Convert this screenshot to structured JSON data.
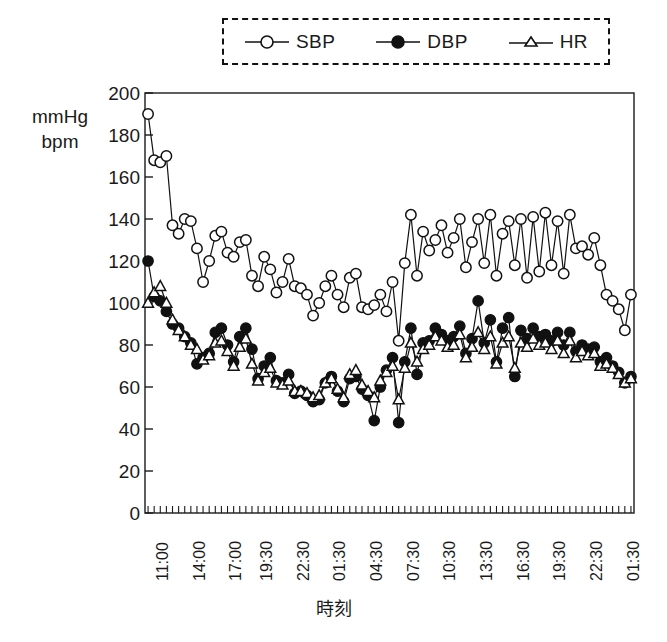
{
  "legend": {
    "position": "top-center",
    "border_style": "dashed",
    "entries": [
      {
        "label": "SBP",
        "marker": "open-circle-icon"
      },
      {
        "label": "DBP",
        "marker": "filled-circle-icon"
      },
      {
        "label": "HR",
        "marker": "open-triangle-icon"
      }
    ]
  },
  "axes": {
    "ylabel_line1": "mmHg",
    "ylabel_line2": "bpm",
    "xlabel": "時刻"
  },
  "chart_data": {
    "type": "line",
    "title": "",
    "subtitle": "",
    "xlabel": "時刻",
    "ylabel": "mmHg bpm",
    "ylim": [
      0,
      200
    ],
    "yticks": [
      0,
      20,
      40,
      60,
      80,
      100,
      120,
      140,
      160,
      180,
      200
    ],
    "grid": false,
    "legend_position": "top-center",
    "x_tick_labels": [
      "11:00",
      "14:00",
      "17:00",
      "19:30",
      "22:30",
      "01:30",
      "04:30",
      "07:30",
      "10:30",
      "13:30",
      "16:30",
      "19:30",
      "22:30",
      "01:30"
    ],
    "x_tick_indices": [
      0,
      6,
      12,
      17,
      23,
      29,
      35,
      41,
      47,
      53,
      59,
      65,
      71,
      77
    ],
    "n_points": 80,
    "series": [
      {
        "name": "SBP",
        "marker": "open-circle",
        "values": [
          190,
          168,
          167,
          170,
          137,
          133,
          140,
          139,
          126,
          110,
          120,
          132,
          134,
          124,
          122,
          129,
          130,
          113,
          108,
          122,
          116,
          105,
          110,
          121,
          108,
          107,
          104,
          94,
          100,
          108,
          113,
          104,
          98,
          112,
          114,
          98,
          97,
          99,
          104,
          96,
          110,
          82,
          119,
          142,
          113,
          134,
          125,
          130,
          137,
          124,
          131,
          140,
          117,
          129,
          140,
          119,
          142,
          113,
          133,
          139,
          118,
          140,
          112,
          141,
          115,
          143,
          118,
          139,
          114,
          142,
          126,
          127,
          123,
          131,
          118,
          104,
          101,
          97,
          87,
          104
        ]
      },
      {
        "name": "DBP",
        "marker": "filled-circle",
        "values": [
          120,
          103,
          101,
          96,
          90,
          88,
          84,
          81,
          71,
          74,
          76,
          86,
          88,
          80,
          72,
          84,
          88,
          78,
          64,
          70,
          74,
          63,
          62,
          66,
          57,
          58,
          56,
          53,
          54,
          62,
          65,
          58,
          53,
          64,
          65,
          59,
          56,
          44,
          60,
          68,
          74,
          43,
          72,
          88,
          66,
          81,
          82,
          88,
          85,
          82,
          84,
          89,
          76,
          83,
          101,
          81,
          92,
          72,
          88,
          93,
          65,
          87,
          83,
          88,
          84,
          85,
          82,
          86,
          80,
          86,
          77,
          80,
          78,
          79,
          72,
          74,
          70,
          67,
          62,
          65
        ]
      },
      {
        "name": "HR",
        "marker": "open-triangle",
        "values": [
          100,
          105,
          108,
          100,
          92,
          87,
          84,
          80,
          78,
          73,
          75,
          81,
          82,
          77,
          70,
          79,
          83,
          71,
          63,
          67,
          69,
          62,
          61,
          63,
          58,
          58,
          57,
          55,
          56,
          62,
          64,
          59,
          55,
          66,
          68,
          61,
          58,
          55,
          63,
          67,
          70,
          54,
          69,
          81,
          72,
          78,
          80,
          84,
          82,
          79,
          80,
          85,
          74,
          79,
          86,
          78,
          84,
          71,
          81,
          84,
          69,
          81,
          79,
          83,
          80,
          81,
          78,
          82,
          76,
          82,
          74,
          77,
          75,
          76,
          70,
          71,
          69,
          66,
          62,
          64
        ]
      }
    ]
  }
}
